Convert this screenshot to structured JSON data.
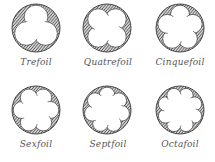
{
  "colors": {
    "hatch": "#444444",
    "outline": "#222222",
    "fill": "#ffffff"
  },
  "foils": [
    {
      "name": "Trefoil",
      "lobes": 3,
      "cx": 36,
      "cy": 28,
      "label_y": 60
    },
    {
      "name": "Quatrefoil",
      "lobes": 4,
      "cx": 107,
      "cy": 28,
      "label_y": 60
    },
    {
      "name": "Cinquefoil",
      "lobes": 5,
      "cx": 180,
      "cy": 28,
      "label_y": 60
    },
    {
      "name": "Sexfoil",
      "lobes": 6,
      "cx": 36,
      "cy": 110,
      "label_y": 141
    },
    {
      "name": "Septfoil",
      "lobes": 7,
      "cx": 107,
      "cy": 110,
      "label_y": 141
    },
    {
      "name": "Octafoil",
      "lobes": 8,
      "cx": 180,
      "cy": 110,
      "label_y": 141
    }
  ],
  "radius": 24
}
